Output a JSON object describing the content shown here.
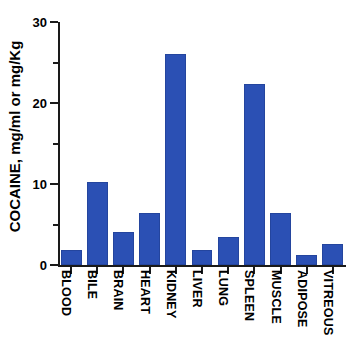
{
  "chart_data": {
    "type": "bar",
    "title": "",
    "subtitle": "",
    "xlabel": "",
    "ylabel": "COCAINE, mg/ml or mg/Kg",
    "categories": [
      "BLOOD",
      "BILE",
      "BRAIN",
      "HEART",
      "KIDNEY",
      "LIVER",
      "LUNG",
      "SPLEEN",
      "MUSCLE",
      "ADIPOSE",
      "VITREOUS"
    ],
    "values": [
      1.9,
      10.2,
      4.1,
      6.4,
      26.0,
      1.8,
      3.5,
      22.3,
      6.4,
      1.2,
      2.6
    ],
    "ylim": [
      0,
      30
    ],
    "yticks": [
      0,
      10,
      20,
      30
    ],
    "ytick_labels": [
      "0",
      "10",
      "20",
      "30"
    ],
    "yminor_ticks": [
      5,
      15,
      25
    ],
    "grid": false,
    "legend": false,
    "legend_position": "none",
    "bar_color": "#2b50b4",
    "axis_color": "#1a1a1a",
    "background_color": "#ffffff"
  }
}
